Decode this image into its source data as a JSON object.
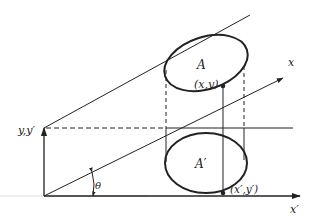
{
  "diagram": {
    "colors": {
      "ink": "#222222",
      "background": "#ffffff"
    },
    "labels": {
      "y_axis": "y,y′",
      "x_axis": "x",
      "x_prime_axis": "x′",
      "angle": "θ",
      "area_upper": "A",
      "area_lower": "A′",
      "point_upper": "(x,y)",
      "point_lower": "(x′,y′)"
    },
    "elements": {
      "origin": [
        44,
        196
      ],
      "y_axis_top": [
        44,
        128
      ],
      "x_prime_axis_end": [
        300,
        196
      ],
      "x_axis_end": [
        283,
        78
      ],
      "upper_parallel_line_end": [
        250,
        15
      ],
      "ellipse_upper": {
        "cx": 206,
        "cy": 63,
        "rx": 42,
        "ry": 28
      },
      "ellipse_lower": {
        "cx": 206,
        "cy": 164,
        "rx": 42,
        "ry": 30
      },
      "point_upper": [
        223,
        86
      ],
      "point_lower": [
        223,
        193
      ]
    }
  }
}
